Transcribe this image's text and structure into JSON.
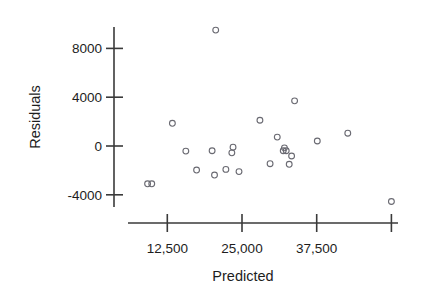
{
  "chart_data": {
    "type": "scatter",
    "title": "",
    "xlabel": "Predicted",
    "ylabel": "Residuals",
    "xlim": [
      8500,
      53000
    ],
    "ylim": [
      -5200,
      10200
    ],
    "grid": false,
    "legend": null,
    "x_ticks": [
      12500,
      25000,
      37500,
      50000
    ],
    "x_tick_labels": [
      "12,500",
      "25,000",
      "37,500",
      ""
    ],
    "y_ticks": [
      -4000,
      0,
      4000,
      8000
    ],
    "y_tick_labels": [
      "-4000",
      "0",
      "4000",
      "8000"
    ],
    "marker": "open-circle",
    "marker_color": "#6a6a72",
    "axis_color": "#3a3a3a",
    "points": [
      {
        "x": 9200,
        "y": -3100
      },
      {
        "x": 9900,
        "y": -3100
      },
      {
        "x": 13350,
        "y": 1860
      },
      {
        "x": 15600,
        "y": -420
      },
      {
        "x": 17400,
        "y": -1970
      },
      {
        "x": 20000,
        "y": -390
      },
      {
        "x": 20600,
        "y": 9500
      },
      {
        "x": 20400,
        "y": -2380
      },
      {
        "x": 22300,
        "y": -1920
      },
      {
        "x": 23500,
        "y": -100
      },
      {
        "x": 23300,
        "y": -560
      },
      {
        "x": 24500,
        "y": -2100
      },
      {
        "x": 28000,
        "y": 2110
      },
      {
        "x": 29700,
        "y": -1450
      },
      {
        "x": 30900,
        "y": 730
      },
      {
        "x": 32100,
        "y": -150
      },
      {
        "x": 31900,
        "y": -390
      },
      {
        "x": 32400,
        "y": -390
      },
      {
        "x": 33300,
        "y": -820
      },
      {
        "x": 32900,
        "y": -1500
      },
      {
        "x": 33800,
        "y": 3700
      },
      {
        "x": 37600,
        "y": 410
      },
      {
        "x": 42700,
        "y": 1050
      },
      {
        "x": 50000,
        "y": -4550
      }
    ]
  },
  "figure": {
    "x_axis_name": "x-axis",
    "y_axis_name": "y-axis"
  }
}
